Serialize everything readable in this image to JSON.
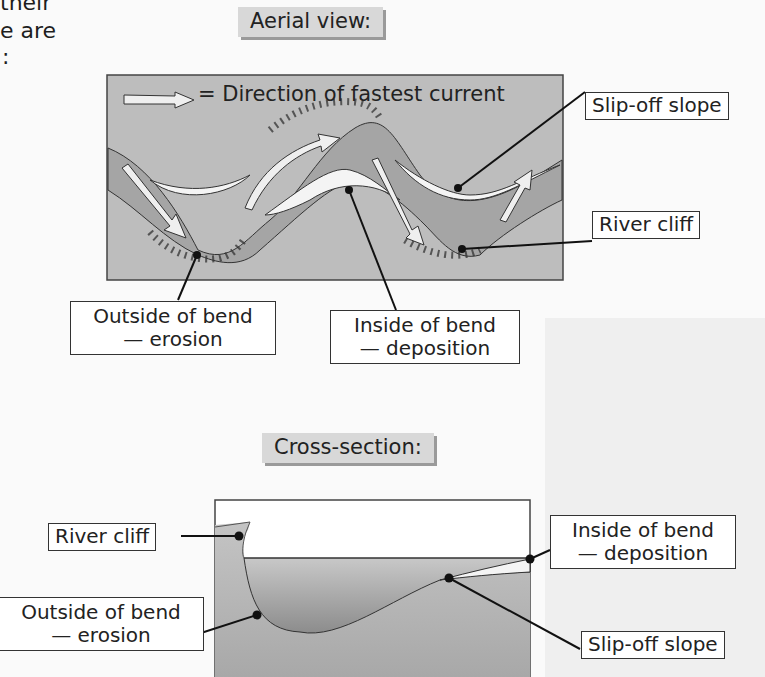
{
  "page_fragment": {
    "line1": "their",
    "line2": "e are",
    "line3": ":"
  },
  "aerial": {
    "heading": "Aerial view:",
    "legend": "= Direction of fastest current",
    "labels": {
      "slip_off_slope": "Slip-off slope",
      "river_cliff": "River cliff",
      "outside_bend_line1": "Outside of bend",
      "outside_bend_line2": "— erosion",
      "inside_bend_line1": "Inside of bend",
      "inside_bend_line2": "— deposition"
    }
  },
  "cross_section": {
    "heading": "Cross-section:",
    "labels": {
      "river_cliff": "River cliff",
      "outside_bend_line1": "Outside of bend",
      "outside_bend_line2": "— erosion",
      "inside_bend_line1": "Inside of bend",
      "inside_bend_line2": "— deposition",
      "slip_off_slope": "Slip-off slope"
    }
  },
  "colors": {
    "land": "#bdbdbd",
    "river": "#a3a3a3",
    "deposit": "#f4f4f4",
    "label_bg": "#ffffff",
    "heading_bg": "#d8d8d8"
  }
}
